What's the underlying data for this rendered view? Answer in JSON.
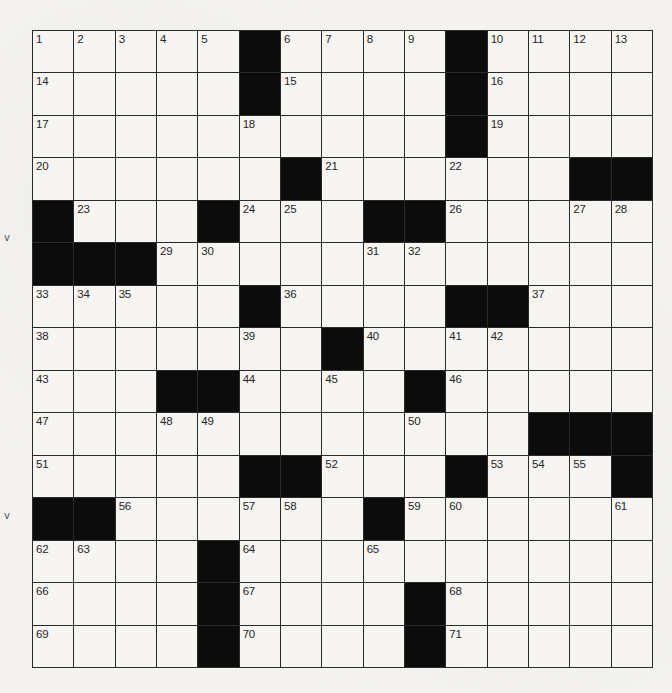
{
  "puzzle": {
    "rows": 15,
    "cols": 15,
    "colors": {
      "black_square": "#0c0c0c",
      "white_square": "#f6f5f2",
      "grid_line": "#2a2a2a",
      "number_text": "#262626"
    },
    "layout": [
      [
        "1",
        "2",
        "3",
        "4",
        "5",
        "#",
        "6",
        "7",
        "8",
        "9",
        "#",
        "10",
        "11",
        "12",
        "13"
      ],
      [
        "14",
        "",
        "",
        "",
        "",
        "#",
        "15",
        "",
        "",
        "",
        "#",
        "16",
        "",
        "",
        ""
      ],
      [
        "17",
        "",
        "",
        "",
        "",
        "18",
        "",
        "",
        "",
        "",
        "#",
        "19",
        "",
        "",
        ""
      ],
      [
        "20",
        "",
        "",
        "",
        "",
        "",
        "#",
        "21",
        "",
        "",
        "22",
        "",
        "",
        "#",
        "#"
      ],
      [
        "#",
        "23",
        "",
        "",
        "#",
        "24",
        "25",
        "",
        "#",
        "#",
        "26",
        "",
        "",
        "27",
        "28"
      ],
      [
        "#",
        "#",
        "#",
        "29",
        "30",
        "",
        "",
        "",
        "31",
        "32",
        "",
        "",
        "",
        "",
        ""
      ],
      [
        "33",
        "34",
        "35",
        "",
        "",
        "#",
        "36",
        "",
        "",
        "",
        "#",
        "#",
        "37",
        "",
        ""
      ],
      [
        "38",
        "",
        "",
        "",
        "",
        "39",
        "",
        "#",
        "40",
        "",
        "41",
        "42",
        "",
        "",
        ""
      ],
      [
        "43",
        "",
        "",
        "#",
        "#",
        "44",
        "",
        "45",
        "",
        "#",
        "46",
        "",
        "",
        "",
        ""
      ],
      [
        "47",
        "",
        "",
        "48",
        "49",
        "",
        "",
        "",
        "",
        "50",
        "",
        "",
        "#",
        "#",
        "#"
      ],
      [
        "51",
        "",
        "",
        "",
        "",
        "#",
        "#",
        "52",
        "",
        "",
        "#",
        "53",
        "54",
        "55",
        "#"
      ],
      [
        "#",
        "#",
        "56",
        "",
        "",
        "57",
        "58",
        "",
        "#",
        "59",
        "60",
        "",
        "",
        "",
        "61"
      ],
      [
        "62",
        "63",
        "",
        "",
        "#",
        "64",
        "",
        "",
        "65",
        "",
        "",
        "",
        "",
        "",
        ""
      ],
      [
        "66",
        "",
        "",
        "",
        "#",
        "67",
        "",
        "",
        "",
        "#",
        "68",
        "",
        "",
        "",
        ""
      ],
      [
        "69",
        "",
        "",
        "",
        "#",
        "70",
        "",
        "",
        "",
        "#",
        "71",
        "",
        "",
        "",
        ""
      ]
    ]
  },
  "margin_marks": [
    {
      "glyph": "v",
      "x": 4,
      "y": 232
    },
    {
      "glyph": "v",
      "x": 4,
      "y": 510
    }
  ]
}
